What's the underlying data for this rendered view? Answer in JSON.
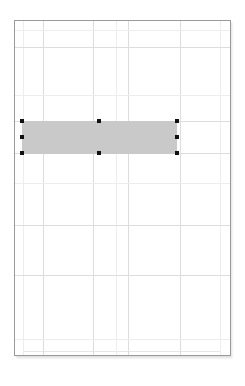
{
  "document": {
    "page": {
      "background_color": "#ffffff",
      "border_color": "#9a9a9a",
      "shadow_color": "#d9d9d9",
      "left": 14,
      "top": 20,
      "width": 217,
      "height": 336
    },
    "margin_guide": {
      "color": "#e7e7e7",
      "left": 23,
      "top": 30,
      "width": 198,
      "height": 322
    },
    "grid": {
      "line_color": "#dddddd",
      "faint_line_color": "#ededed",
      "vertical_lines": [
        {
          "x": 23,
          "faint": true
        },
        {
          "x": 43,
          "faint": false
        },
        {
          "x": 93,
          "faint": false
        },
        {
          "x": 116,
          "faint": true
        },
        {
          "x": 128,
          "faint": false
        },
        {
          "x": 180,
          "faint": false
        },
        {
          "x": 220,
          "faint": true
        }
      ],
      "horizontal_lines": [
        {
          "y": 30,
          "faint": true
        },
        {
          "y": 47,
          "faint": false
        },
        {
          "y": 95,
          "faint": true
        },
        {
          "y": 121,
          "faint": false
        },
        {
          "y": 153,
          "faint": false
        },
        {
          "y": 183,
          "faint": true
        },
        {
          "y": 225,
          "faint": false
        },
        {
          "y": 275,
          "faint": false
        },
        {
          "y": 339,
          "faint": true
        }
      ]
    },
    "selection": {
      "shape_name": "rectangle",
      "fill_color": "#c9c9c9",
      "left": 22,
      "top": 121,
      "width": 155,
      "height": 33,
      "handle_color": "#111111",
      "handle_size": 4,
      "handles": [
        {
          "name": "handle-top-left",
          "x": 20,
          "y": 119
        },
        {
          "name": "handle-top-center",
          "x": 97,
          "y": 119
        },
        {
          "name": "handle-top-right",
          "x": 175,
          "y": 119
        },
        {
          "name": "handle-middle-left",
          "x": 20,
          "y": 135
        },
        {
          "name": "handle-middle-right",
          "x": 175,
          "y": 135
        },
        {
          "name": "handle-bottom-left",
          "x": 20,
          "y": 151
        },
        {
          "name": "handle-bottom-center",
          "x": 97,
          "y": 151
        },
        {
          "name": "handle-bottom-right",
          "x": 175,
          "y": 151
        }
      ]
    }
  }
}
